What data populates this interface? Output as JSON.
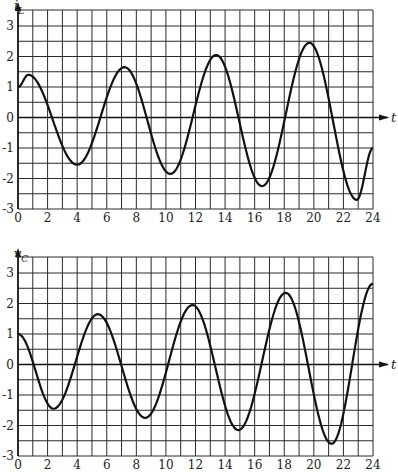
{
  "chart_data": [
    {
      "type": "line",
      "title": "",
      "ylabel": "i_L",
      "xlabel": "t",
      "xlim": [
        0,
        24
      ],
      "ylim": [
        -3,
        3
      ],
      "x_ticks": [
        0,
        2,
        4,
        6,
        8,
        10,
        12,
        14,
        16,
        18,
        20,
        22,
        24
      ],
      "y_ticks": [
        -3,
        -2,
        -1,
        0,
        1,
        2,
        3
      ],
      "grid": true,
      "grid_x_step": 1,
      "grid_y_step": 0.5,
      "extrema": [
        {
          "t": 0,
          "v": 1.0
        },
        {
          "t": 0.7,
          "v": 1.4
        },
        {
          "t": 4.0,
          "v": -1.55
        },
        {
          "t": 7.2,
          "v": 1.65
        },
        {
          "t": 10.3,
          "v": -1.85
        },
        {
          "t": 13.4,
          "v": 2.05
        },
        {
          "t": 16.5,
          "v": -2.25
        },
        {
          "t": 19.7,
          "v": 2.45
        },
        {
          "t": 22.9,
          "v": -2.7
        },
        {
          "t": 24,
          "v": -1.0
        }
      ],
      "series": [
        {
          "name": "i_L",
          "x": [
            0,
            0.7,
            4.0,
            7.2,
            10.3,
            13.4,
            16.5,
            19.7,
            22.9,
            24
          ],
          "values": [
            1.0,
            1.4,
            -1.55,
            1.65,
            -1.85,
            2.05,
            -2.25,
            2.45,
            -2.7,
            -1.0
          ]
        }
      ]
    },
    {
      "type": "line",
      "title": "",
      "ylabel": "v_C",
      "xlabel": "t",
      "xlim": [
        0,
        24
      ],
      "ylim": [
        -3,
        3
      ],
      "x_ticks": [
        0,
        2,
        4,
        6,
        8,
        10,
        12,
        14,
        16,
        18,
        20,
        22,
        24
      ],
      "y_ticks": [
        -3,
        -2,
        -1,
        0,
        1,
        2,
        3
      ],
      "grid": true,
      "grid_x_step": 1,
      "grid_y_step": 0.5,
      "extrema": [
        {
          "t": 0,
          "v": 1.0
        },
        {
          "t": 2.4,
          "v": -1.45
        },
        {
          "t": 5.4,
          "v": 1.65
        },
        {
          "t": 8.6,
          "v": -1.75
        },
        {
          "t": 11.8,
          "v": 1.95
        },
        {
          "t": 14.9,
          "v": -2.15
        },
        {
          "t": 18.1,
          "v": 2.35
        },
        {
          "t": 21.2,
          "v": -2.6
        },
        {
          "t": 24,
          "v": 2.65
        }
      ],
      "series": [
        {
          "name": "v_C",
          "x": [
            0,
            2.4,
            5.4,
            8.6,
            11.8,
            14.9,
            18.1,
            21.2,
            24
          ],
          "values": [
            1.0,
            -1.45,
            1.65,
            -1.75,
            1.95,
            -2.15,
            2.35,
            -2.6,
            2.65
          ]
        }
      ]
    }
  ],
  "panels": [
    {
      "id": "top",
      "ylabel_main": "i",
      "ylabel_sub": "L",
      "xlabel": "t",
      "x_tick_labels": [
        "0",
        "2",
        "4",
        "6",
        "8",
        "10",
        "12",
        "14",
        "16",
        "18",
        "20",
        "22",
        "24"
      ],
      "y_tick_labels": [
        "3",
        "2",
        "1",
        "0",
        "-1",
        "-2",
        "-3"
      ]
    },
    {
      "id": "bottom",
      "ylabel_main": "v",
      "ylabel_sub": "C",
      "xlabel": "t",
      "x_tick_labels": [
        "0",
        "2",
        "4",
        "6",
        "8",
        "10",
        "12",
        "14",
        "16",
        "18",
        "20",
        "22",
        "24"
      ],
      "y_tick_labels": [
        "3",
        "2",
        "1",
        "0",
        "-1",
        "-2",
        "-3"
      ]
    }
  ],
  "colors": {
    "grid": "#2a2a2a",
    "curve": "#111111",
    "background": "#ffffff"
  }
}
